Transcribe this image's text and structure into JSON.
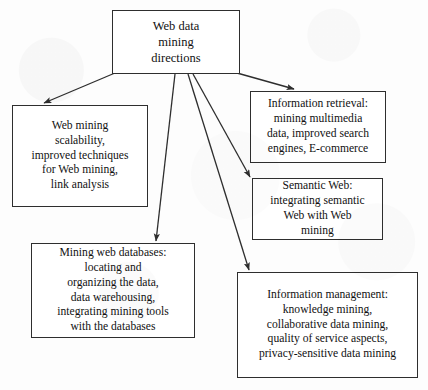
{
  "diagram": {
    "type": "hierarchy-tree",
    "title": "Web data mining directions",
    "background_color": "#fdfdfd",
    "line_color": "#2e2e2e",
    "box_fill_color": "#ffffff",
    "root": {
      "id": "root",
      "label": "Web data\nmining\ndirections"
    },
    "branches": [
      {
        "id": "web-mining",
        "label": "Web mining\nscalability,\nimproved techniques\nfor Web mining,\nlink analysis"
      },
      {
        "id": "info-retrieval",
        "label": "Information retrieval:\nmining multimedia\ndata, improved search\nengines, E-commerce"
      },
      {
        "id": "semantic-web",
        "label": "Semantic Web:\nintegrating semantic\nWeb with Web\nmining"
      },
      {
        "id": "mining-web-databases",
        "label": "Mining web databases:\nlocating and\norganizing the data,\ndata warehousing,\nintegrating mining tools\nwith the databases"
      },
      {
        "id": "info-management",
        "label": "Information management:\nknowledge mining,\ncollaborative data mining,\nquality of service aspects,\nprivacy-sensitive data mining"
      }
    ]
  }
}
